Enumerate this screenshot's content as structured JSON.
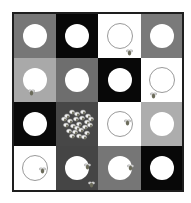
{
  "game": {
    "title": "Bee grid puzzle",
    "grid": {
      "rows": 4,
      "cols": 4,
      "border_color": "#1e1e1e",
      "cells": [
        {
          "row": 0,
          "col": 0,
          "bg": "#777777",
          "circle": "filled",
          "bees": []
        },
        {
          "row": 0,
          "col": 1,
          "bg": "#080808",
          "circle": "filled",
          "bees": []
        },
        {
          "row": 0,
          "col": 2,
          "bg": "#ffffff",
          "circle": "outline",
          "bees": [
            {
              "x": 28,
              "y": 27
            }
          ]
        },
        {
          "row": 0,
          "col": 3,
          "bg": "#7a7a7a",
          "circle": "filled",
          "bees": []
        },
        {
          "row": 1,
          "col": 0,
          "bg": "#a9a9a9",
          "circle": "filled",
          "bees": [
            {
              "x": 14,
              "y": 23
            }
          ]
        },
        {
          "row": 1,
          "col": 1,
          "bg": "#6e6e6e",
          "circle": "filled",
          "bees": []
        },
        {
          "row": 1,
          "col": 2,
          "bg": "#080808",
          "circle": "filled",
          "bees": []
        },
        {
          "row": 1,
          "col": 3,
          "bg": "#ffffff",
          "circle": "outline",
          "bees": [
            {
              "x": 9,
              "y": 26
            }
          ]
        },
        {
          "row": 2,
          "col": 0,
          "bg": "#0a0a0a",
          "circle": "filled",
          "bees": []
        },
        {
          "row": 2,
          "col": 1,
          "bg": "#474747",
          "circle": "none",
          "swarm": true,
          "bees": []
        },
        {
          "row": 2,
          "col": 2,
          "bg": "#ffffff",
          "circle": "outline",
          "bees": [
            {
              "x": 26,
              "y": 9
            }
          ]
        },
        {
          "row": 2,
          "col": 3,
          "bg": "#adadad",
          "circle": "filled",
          "bees": []
        },
        {
          "row": 3,
          "col": 0,
          "bg": "#ffffff",
          "circle": "outline",
          "bees": [
            {
              "x": 25,
              "y": 13
            }
          ]
        },
        {
          "row": 3,
          "col": 1,
          "bg": "#454545",
          "circle": "filled",
          "bees": [
            {
              "x": 28,
              "y": 9
            },
            {
              "x": 32,
              "y": 27
            }
          ]
        },
        {
          "row": 3,
          "col": 2,
          "bg": "#767676",
          "circle": "filled",
          "bees": [
            {
              "x": 29,
              "y": 10
            }
          ]
        },
        {
          "row": 3,
          "col": 3,
          "bg": "#080808",
          "circle": "filled",
          "bees": []
        }
      ]
    },
    "colors": {
      "bee_body": "#6b6b5a",
      "bee_wing": "#d8d8d8",
      "circle_fill": "#ffffff",
      "circle_outline": "#9a9a9a"
    }
  }
}
